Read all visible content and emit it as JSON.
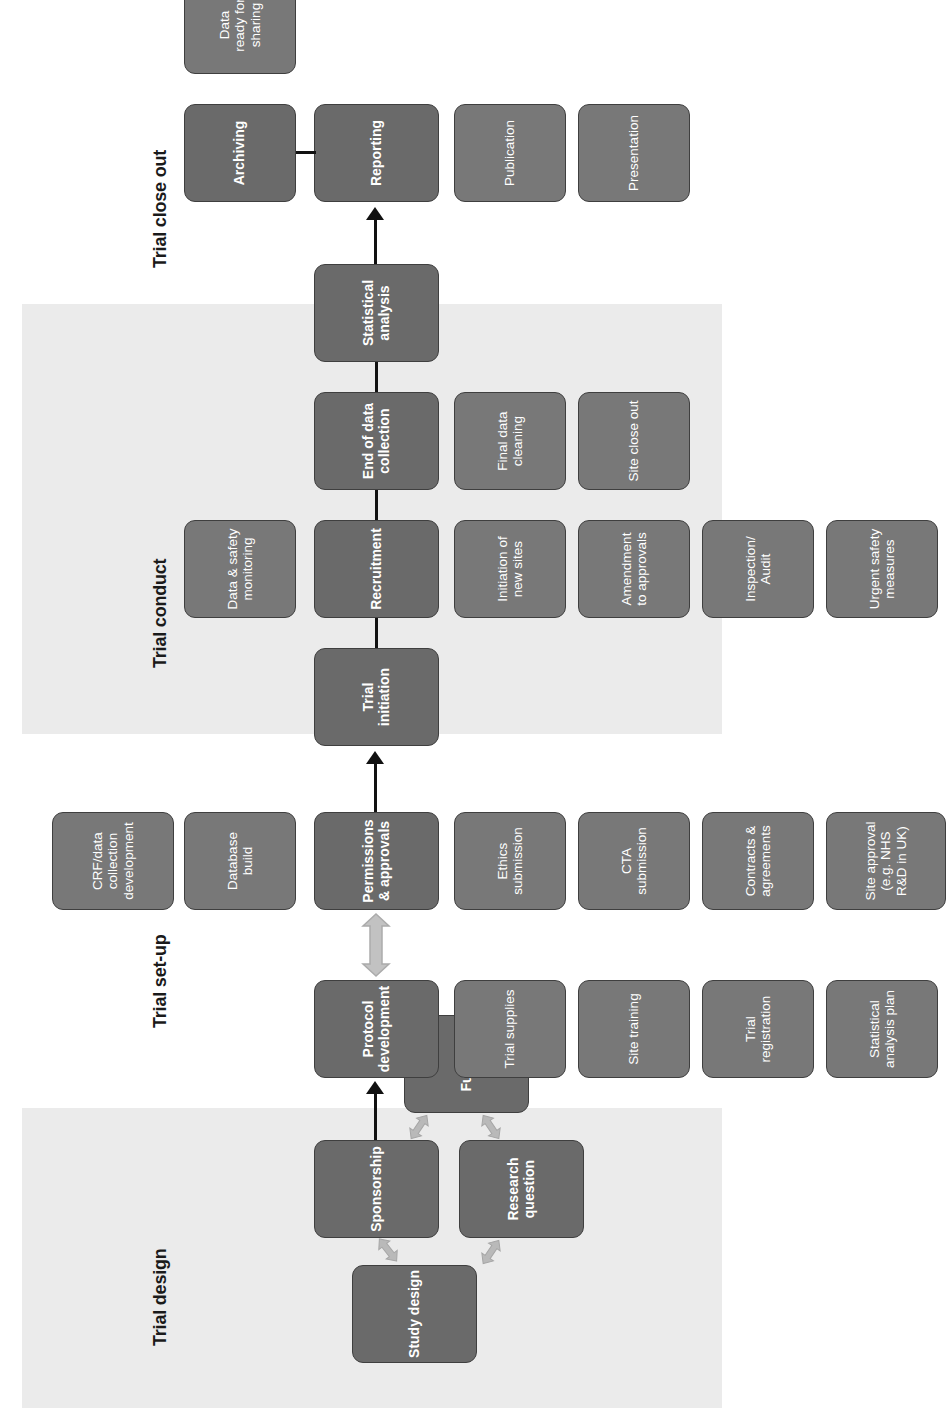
{
  "figure": {
    "orientation": "rotated-90-ccw",
    "background": "#ffffff",
    "band_color": "#ebebeb",
    "node_color": "#6f6f6f",
    "node_border_color": "#3f3f3f",
    "node_text_color": "#ffffff",
    "arrow_color": "#111111",
    "double_arrow_color": "#b7b7b7"
  },
  "phases": [
    {
      "id": "trial-design",
      "label": "Trial design",
      "shaded": true,
      "main_nodes": [
        {
          "id": "sponsorship",
          "label": "Sponsorship"
        }
      ],
      "satellite_nodes": [
        {
          "id": "study-design",
          "label": "Study design"
        },
        {
          "id": "research-question",
          "label": "Research\nquestion"
        },
        {
          "id": "funding",
          "label": "Funding"
        }
      ]
    },
    {
      "id": "trial-set-up",
      "label": "Trial set-up",
      "shaded": false,
      "main_nodes": [
        {
          "id": "protocol-development",
          "label": "Protocol\ndevelopment"
        },
        {
          "id": "permissions-approvals",
          "label": "Permissions\n& approvals"
        }
      ],
      "satellite_nodes": [
        {
          "id": "trial-supplies",
          "label": "Trial supplies"
        },
        {
          "id": "site-training",
          "label": "Site training"
        },
        {
          "id": "trial-registration",
          "label": "Trial\nregistration"
        },
        {
          "id": "statistical-analysis-plan",
          "label": "Statistical\nanalysis plan"
        },
        {
          "id": "crf-data-collection-development",
          "label": "CRF/data\ncollection\ndevelopment"
        },
        {
          "id": "database-build",
          "label": "Database\nbuild"
        },
        {
          "id": "ethics-submission",
          "label": "Ethics\nsubmission"
        },
        {
          "id": "cta-submission",
          "label": "CTA\nsubmission"
        },
        {
          "id": "contracts-agreements",
          "label": "Contracts &\nagreements"
        },
        {
          "id": "site-approval",
          "label": "Site approval\n(e.g. NHS\nR&D in UK)"
        }
      ]
    },
    {
      "id": "trial-conduct",
      "label": "Trial conduct",
      "shaded": true,
      "main_nodes": [
        {
          "id": "trial-initiation",
          "label": "Trial\ninitiation"
        },
        {
          "id": "recruitment",
          "label": "Recruitment"
        },
        {
          "id": "end-of-data-collection",
          "label": "End of data\ncollection"
        },
        {
          "id": "statistical-analysis",
          "label": "Statistical\nanalysis"
        }
      ],
      "satellite_nodes": [
        {
          "id": "data-safety-monitoring",
          "label": "Data & safety\nmonitoring"
        },
        {
          "id": "initiation-of-new-sites",
          "label": "Initiation of\nnew sites"
        },
        {
          "id": "amendment-to-approvals",
          "label": "Amendment\nto approvals"
        },
        {
          "id": "inspection-audit",
          "label": "Inspection/\nAudit"
        },
        {
          "id": "urgent-safety-measures",
          "label": "Urgent safety\nmeasures"
        },
        {
          "id": "final-data-cleaning",
          "label": "Final data\ncleaning"
        },
        {
          "id": "site-close-out",
          "label": "Site close out"
        }
      ]
    },
    {
      "id": "trial-close-out",
      "label": "Trial close out",
      "shaded": false,
      "main_nodes": [
        {
          "id": "reporting",
          "label": "Reporting"
        },
        {
          "id": "archiving",
          "label": "Archiving"
        }
      ],
      "satellite_nodes": [
        {
          "id": "publication",
          "label": "Publication"
        },
        {
          "id": "presentation",
          "label": "Presentation"
        },
        {
          "id": "data-ready-for-sharing",
          "label": "Data\nready for\nsharing"
        }
      ]
    }
  ],
  "nodes": {
    "study_design": "Study design",
    "sponsorship": "Sponsorship",
    "research_question": "Research\nquestion",
    "funding": "Funding",
    "protocol_development": "Protocol\ndevelopment",
    "trial_supplies": "Trial supplies",
    "site_training": "Site training",
    "trial_registration": "Trial\nregistration",
    "statistical_analysis_plan": "Statistical\nanalysis plan",
    "crf_data_collection_development": "CRF/data\ncollection\ndevelopment",
    "database_build": "Database\nbuild",
    "permissions_approvals": "Permissions\n& approvals",
    "ethics_submission": "Ethics\nsubmission",
    "cta_submission": "CTA\nsubmission",
    "contracts_agreements": "Contracts &\nagreements",
    "site_approval": "Site approval\n(e.g. NHS\nR&D in UK)",
    "trial_initiation": "Trial\ninitiation",
    "data_safety_monitoring": "Data & safety\nmonitoring",
    "recruitment": "Recruitment",
    "initiation_of_new_sites": "Initiation of\nnew sites",
    "amendment_to_approvals": "Amendment\nto approvals",
    "inspection_audit": "Inspection/\nAudit",
    "urgent_safety_measures": "Urgent safety\nmeasures",
    "end_of_data_collection": "End of data\ncollection",
    "final_data_cleaning": "Final data\ncleaning",
    "site_close_out": "Site close out",
    "statistical_analysis": "Statistical\nanalysis",
    "reporting": "Reporting",
    "publication": "Publication",
    "presentation": "Presentation",
    "archiving": "Archiving",
    "data_ready_for_sharing": "Data\nready for\nsharing"
  },
  "band_labels": {
    "trial_design": "Trial design",
    "trial_set_up": "Trial set-up",
    "trial_conduct": "Trial conduct",
    "trial_close_out": "Trial close out"
  },
  "edge_caption": ""
}
